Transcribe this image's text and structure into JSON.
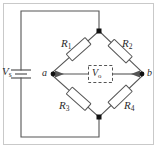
{
  "figure": {
    "width": 157,
    "height": 148,
    "background": "#ffffff",
    "line_color": "#555555",
    "node_color": "#111111",
    "text_color": "#2b2b2b"
  },
  "source": {
    "label": "V",
    "subscript": "s",
    "symbol": "battery-cell"
  },
  "nodes": {
    "left": "a",
    "right": "b",
    "top": "",
    "bottom": ""
  },
  "output": {
    "label": "V",
    "subscript": "o",
    "border": "dashed"
  },
  "resistors": [
    {
      "id": "R1",
      "label": "R",
      "subscript": "1",
      "position": "top-left"
    },
    {
      "id": "R2",
      "label": "R",
      "subscript": "2",
      "position": "top-right"
    },
    {
      "id": "R3",
      "label": "R",
      "subscript": "3",
      "position": "bottom-left"
    },
    {
      "id": "R4",
      "label": "R",
      "subscript": "4",
      "position": "bottom-right"
    }
  ]
}
